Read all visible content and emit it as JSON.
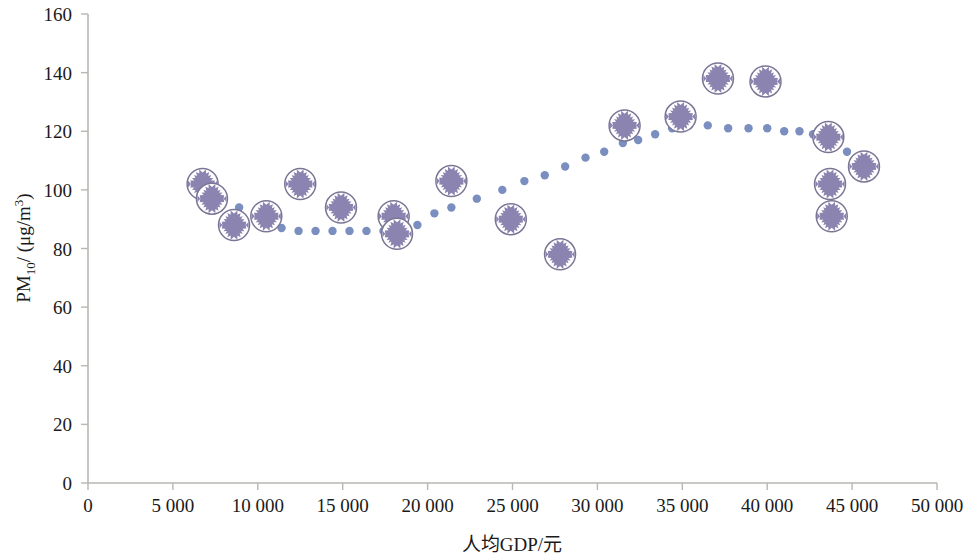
{
  "chart_data": {
    "type": "scatter",
    "title": "",
    "xlabel": "人均GDP/元",
    "ylabel_parts": {
      "main": "PM",
      "sub": "10",
      "unit": "/ (μg/m",
      "unit_sup": "3",
      "unit_end": ")"
    },
    "ylabel": "PM10/ (μg/m3)",
    "xlim": [
      0,
      50000
    ],
    "ylim": [
      0,
      160
    ],
    "xticks": [
      0,
      5000,
      10000,
      15000,
      20000,
      25000,
      30000,
      35000,
      40000,
      45000,
      50000
    ],
    "xtick_labels": [
      "0",
      "5 000",
      "10 000",
      "15 000",
      "20 000",
      "25 000",
      "30 000",
      "35 000",
      "40 000",
      "45 000",
      "50 000"
    ],
    "yticks": [
      0,
      20,
      40,
      60,
      80,
      100,
      120,
      140,
      160
    ],
    "ytick_labels": [
      "0",
      "20",
      "40",
      "60",
      "80",
      "100",
      "120",
      "140",
      "160"
    ],
    "grid": false,
    "legend": "none",
    "series": [
      {
        "name": "PM10 observations",
        "marker": "circle-star",
        "color": "#8b84b0",
        "outline": "#7b7596",
        "points": [
          {
            "x": 6750,
            "y": 102
          },
          {
            "x": 7300,
            "y": 97
          },
          {
            "x": 8600,
            "y": 88
          },
          {
            "x": 10500,
            "y": 91
          },
          {
            "x": 12500,
            "y": 102
          },
          {
            "x": 14900,
            "y": 94
          },
          {
            "x": 18000,
            "y": 91
          },
          {
            "x": 18200,
            "y": 85
          },
          {
            "x": 21400,
            "y": 103
          },
          {
            "x": 24900,
            "y": 90
          },
          {
            "x": 27800,
            "y": 78
          },
          {
            "x": 31600,
            "y": 122
          },
          {
            "x": 34900,
            "y": 125
          },
          {
            "x": 37100,
            "y": 138
          },
          {
            "x": 39900,
            "y": 137
          },
          {
            "x": 43600,
            "y": 118
          },
          {
            "x": 45700,
            "y": 108
          },
          {
            "x": 43700,
            "y": 102
          },
          {
            "x": 43800,
            "y": 91
          }
        ]
      },
      {
        "name": "Fitted trend",
        "marker": "dot",
        "color": "#7a8fbf",
        "style": "dotted",
        "points": [
          {
            "x": 8900,
            "y": 94
          },
          {
            "x": 10400,
            "y": 91
          },
          {
            "x": 11400,
            "y": 87
          },
          {
            "x": 12400,
            "y": 86
          },
          {
            "x": 13400,
            "y": 86
          },
          {
            "x": 14400,
            "y": 86
          },
          {
            "x": 15400,
            "y": 86
          },
          {
            "x": 16400,
            "y": 86
          },
          {
            "x": 17400,
            "y": 86
          },
          {
            "x": 18400,
            "y": 86
          },
          {
            "x": 19400,
            "y": 88
          },
          {
            "x": 20400,
            "y": 92
          },
          {
            "x": 21400,
            "y": 94
          },
          {
            "x": 22900,
            "y": 97
          },
          {
            "x": 24400,
            "y": 100
          },
          {
            "x": 25700,
            "y": 103
          },
          {
            "x": 26900,
            "y": 105
          },
          {
            "x": 28100,
            "y": 108
          },
          {
            "x": 29300,
            "y": 111
          },
          {
            "x": 30400,
            "y": 113
          },
          {
            "x": 31500,
            "y": 116
          },
          {
            "x": 32400,
            "y": 117
          },
          {
            "x": 33400,
            "y": 119
          },
          {
            "x": 34400,
            "y": 121
          },
          {
            "x": 35400,
            "y": 122
          },
          {
            "x": 36500,
            "y": 122
          },
          {
            "x": 37700,
            "y": 121
          },
          {
            "x": 38900,
            "y": 121
          },
          {
            "x": 40000,
            "y": 121
          },
          {
            "x": 41000,
            "y": 120
          },
          {
            "x": 41900,
            "y": 120
          },
          {
            "x": 42700,
            "y": 119
          },
          {
            "x": 43400,
            "y": 118
          },
          {
            "x": 44100,
            "y": 116
          },
          {
            "x": 44700,
            "y": 113
          }
        ]
      }
    ]
  },
  "plot_geometry": {
    "left": 88,
    "right": 937,
    "top": 14,
    "bottom": 483
  }
}
